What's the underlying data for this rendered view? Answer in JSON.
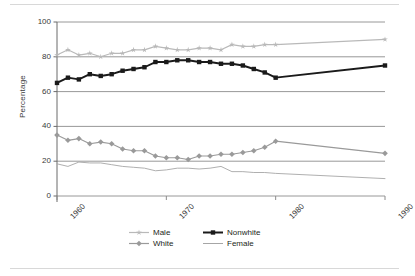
{
  "chart_data": {
    "type": "line",
    "title": "",
    "xlabel": "",
    "ylabel": "Percentage",
    "xlim": [
      1960,
      1990
    ],
    "ylim": [
      0,
      100
    ],
    "grid": true,
    "grid_axis": "y",
    "legend_position": "bottom",
    "y_ticks": [
      0,
      20,
      40,
      60,
      80,
      100
    ],
    "x_ticks": [
      1960,
      1970,
      1980,
      1990
    ],
    "x_tick_labels": [
      "1960",
      "1970",
      "1980",
      "1990"
    ],
    "series": [
      {
        "name": "Male",
        "color": "#b9b9b9",
        "marker": "star",
        "x": [
          1960,
          1961,
          1962,
          1963,
          1964,
          1965,
          1966,
          1967,
          1968,
          1969,
          1970,
          1971,
          1972,
          1973,
          1974,
          1975,
          1976,
          1977,
          1978,
          1979,
          1980,
          1990
        ],
        "values": [
          81,
          84,
          81,
          82,
          80,
          82,
          82,
          84,
          84,
          86,
          85,
          84,
          84,
          85,
          85,
          84,
          87,
          86,
          86,
          87,
          87,
          90
        ]
      },
      {
        "name": "Nonwhite",
        "color": "#1a1a1a",
        "marker": "square",
        "x": [
          1960,
          1961,
          1962,
          1963,
          1964,
          1965,
          1966,
          1967,
          1968,
          1969,
          1970,
          1971,
          1972,
          1973,
          1974,
          1975,
          1976,
          1977,
          1978,
          1979,
          1980,
          1990
        ],
        "values": [
          65,
          68,
          67,
          70,
          69,
          70,
          72,
          73,
          74,
          77,
          77,
          78,
          78,
          77,
          77,
          76,
          76,
          75,
          73,
          71,
          68,
          75
        ]
      },
      {
        "name": "White",
        "color": "#9a9a9a",
        "marker": "diamond",
        "x": [
          1960,
          1961,
          1962,
          1963,
          1964,
          1965,
          1966,
          1967,
          1968,
          1969,
          1970,
          1971,
          1972,
          1973,
          1974,
          1975,
          1976,
          1977,
          1978,
          1979,
          1980,
          1990
        ],
        "values": [
          35,
          32,
          33,
          30,
          31,
          30,
          27,
          26,
          26,
          23,
          22,
          22,
          21,
          23,
          23,
          24,
          24,
          25,
          26,
          28,
          31.5,
          24.5
        ]
      },
      {
        "name": "Female",
        "color": "#a6a6a6",
        "marker": "none",
        "x": [
          1960,
          1961,
          1962,
          1963,
          1964,
          1965,
          1966,
          1967,
          1968,
          1969,
          1970,
          1971,
          1972,
          1973,
          1974,
          1975,
          1976,
          1977,
          1978,
          1979,
          1980,
          1990
        ],
        "values": [
          18.5,
          17,
          19.5,
          19,
          19,
          18,
          17,
          16.5,
          16,
          14.5,
          15,
          16,
          16,
          15.5,
          16,
          17,
          14,
          14,
          13.5,
          13.5,
          13,
          10
        ]
      }
    ]
  },
  "axis": {
    "y_label": "Percentage",
    "y_ticks": [
      "100",
      "80",
      "60",
      "40",
      "20",
      "0"
    ],
    "x_ticks": [
      "1960",
      "1970",
      "1980",
      "1990"
    ]
  },
  "legend": {
    "items": [
      {
        "label": "Male",
        "color": "#b9b9b9",
        "marker": "star"
      },
      {
        "label": "Nonwhite",
        "color": "#1a1a1a",
        "marker": "square"
      },
      {
        "label": "White",
        "color": "#9a9a9a",
        "marker": "diamond"
      },
      {
        "label": "Female",
        "color": "#a6a6a6",
        "marker": "none"
      }
    ]
  }
}
